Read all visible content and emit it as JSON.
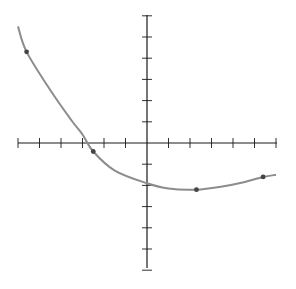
{
  "chart_data": {
    "type": "line",
    "title": "",
    "xlabel": "",
    "ylabel": "",
    "grid": false,
    "legend": null,
    "xlim": [
      -6,
      6
    ],
    "ylim": [
      -6,
      6
    ],
    "x_ticks": [
      -6,
      -5,
      -4,
      -3,
      -2,
      -1,
      1,
      2,
      3,
      4,
      5,
      6
    ],
    "y_ticks": [
      -6,
      -5,
      -4,
      -3,
      -2,
      -1,
      1,
      2,
      3,
      4,
      5,
      6
    ],
    "tick_labels_visible": false,
    "series": [
      {
        "name": "curve",
        "style": "smooth",
        "color": "#8a8a8a",
        "curve_x": [
          -6.0,
          -5.6,
          -4.5,
          -3.5,
          -3.0,
          -2.5,
          -1.5,
          0.0,
          1.0,
          2.3,
          3.5,
          4.5,
          5.4,
          6.0
        ],
        "curve_y": [
          5.5,
          4.3,
          2.5,
          1.05,
          0.4,
          -0.4,
          -1.3,
          -1.9,
          -2.15,
          -2.2,
          -2.05,
          -1.85,
          -1.6,
          -1.5
        ]
      }
    ],
    "points": [
      {
        "x": -5.6,
        "y": 4.3
      },
      {
        "x": -2.5,
        "y": -0.4
      },
      {
        "x": 2.3,
        "y": -2.2
      },
      {
        "x": 5.4,
        "y": -1.6
      }
    ]
  },
  "colors": {
    "axis": "#1a1a1a",
    "curve": "#8c8c8c",
    "point": "#444444",
    "background": "#ffffff"
  }
}
